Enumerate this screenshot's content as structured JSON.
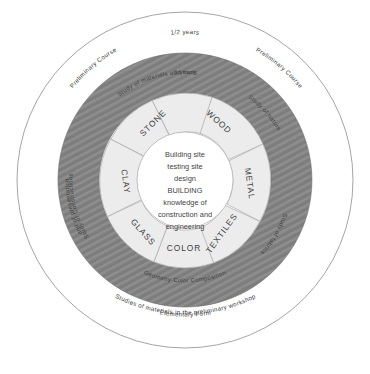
{
  "diagram": {
    "center_radius": 48,
    "inner_ring_outer_radius": 86,
    "dark_ring_outer_radius": 127,
    "outer_ring_outer_radius": 168,
    "colors": {
      "dark_ring": "#7d7d7d",
      "dark_ring_hatch": "#8d8d8d",
      "inner_ring": "#ececec",
      "core": "#ffffff",
      "outline": "#9a9a9a",
      "text": "#3f3f3f"
    }
  },
  "core": {
    "lines": [
      "Building site",
      "testing site",
      "design",
      "BUILDING",
      "knowledge of",
      "construction and",
      "engineering"
    ]
  },
  "segments": [
    {
      "label": "STONE"
    },
    {
      "label": "WOOD"
    },
    {
      "label": "METAL"
    },
    {
      "label": "TEXTILES"
    },
    {
      "label": "COLOR"
    },
    {
      "label": "GLASS"
    },
    {
      "label": "CLAY"
    }
  ],
  "dark_ring_labels": [
    {
      "text": "3 years"
    },
    {
      "text": "Study of nature"
    },
    {
      "text": "Study of fabrics"
    },
    {
      "text": "Geometry  Color  Composition"
    },
    {
      "text": "Study of Constructions"
    },
    {
      "text": "and of presentation"
    },
    {
      "text": "Study of materials and tools"
    }
  ],
  "outer_ring_labels": [
    {
      "text": "1/2 years"
    },
    {
      "text": "Preliminary Course"
    },
    {
      "text": "Preliminary Course"
    },
    {
      "text": "Elementary Form"
    },
    {
      "text": "Studies of materials in the preliminary workshop"
    }
  ]
}
